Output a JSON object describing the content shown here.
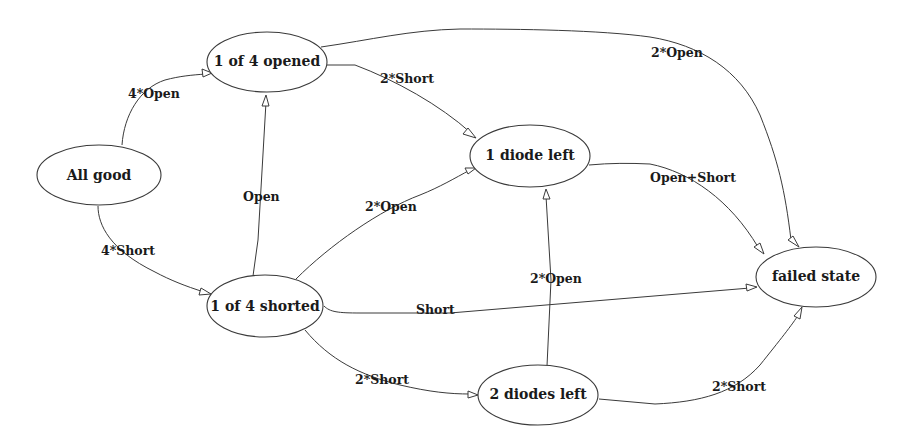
{
  "diagram": {
    "type": "state-transition-graph",
    "nodes": [
      {
        "id": "all_good",
        "label": "All good"
      },
      {
        "id": "opened",
        "label": "1 of 4 opened"
      },
      {
        "id": "shorted",
        "label": "1 of 4 shorted"
      },
      {
        "id": "one_diode",
        "label": "1 diode left"
      },
      {
        "id": "two_diodes",
        "label": "2 diodes left"
      },
      {
        "id": "failed",
        "label": "failed state"
      }
    ],
    "edges": [
      {
        "from": "all_good",
        "to": "opened",
        "label": "4*Open"
      },
      {
        "from": "all_good",
        "to": "shorted",
        "label": "4*Short"
      },
      {
        "from": "shorted",
        "to": "opened",
        "label": "Open"
      },
      {
        "from": "opened",
        "to": "one_diode",
        "label": "2*Short"
      },
      {
        "from": "opened",
        "to": "failed",
        "label": "2*Open"
      },
      {
        "from": "shorted",
        "to": "one_diode",
        "label": "2*Open"
      },
      {
        "from": "shorted",
        "to": "failed",
        "label": "Short"
      },
      {
        "from": "shorted",
        "to": "two_diodes",
        "label": "2*Short"
      },
      {
        "from": "two_diodes",
        "to": "one_diode",
        "label": "2*Open"
      },
      {
        "from": "one_diode",
        "to": "failed",
        "label": "Open+Short"
      },
      {
        "from": "two_diodes",
        "to": "failed",
        "label": "2*Short"
      }
    ]
  }
}
